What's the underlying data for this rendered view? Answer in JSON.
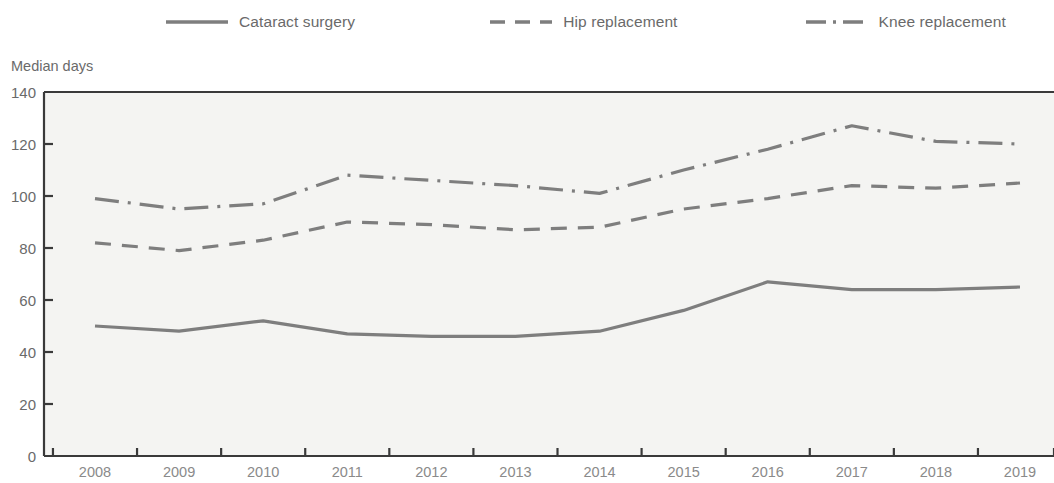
{
  "legend": {
    "items": [
      {
        "label": "Cataract surgery",
        "style": "solid",
        "icon": "solid-line-icon"
      },
      {
        "label": "Hip replacement",
        "style": "dashed",
        "icon": "dashed-line-icon"
      },
      {
        "label": "Knee replacement",
        "style": "dash-dot",
        "icon": "dash-dot-line-icon"
      }
    ]
  },
  "axis": {
    "y_title": "Median days",
    "y_ticks": [
      "0",
      "20",
      "40",
      "60",
      "80",
      "100",
      "120",
      "140"
    ],
    "x_ticks": [
      "2008",
      "2009",
      "2010",
      "2011",
      "2012",
      "2013",
      "2014",
      "2015",
      "2016",
      "2017",
      "2018",
      "2019"
    ]
  },
  "colors": {
    "line": "#7e7e7e",
    "axis": "#3a3a3a",
    "plot_background": "#f4f4f2",
    "tick_text": "#6a6a6a"
  },
  "chart_data": {
    "type": "line",
    "title": "",
    "subtitle": "",
    "xlabel": "",
    "ylabel": "Median days",
    "ylim": [
      0,
      140
    ],
    "ytick_step": 20,
    "grid": false,
    "legend_position": "top",
    "x": [
      2008,
      2009,
      2010,
      2011,
      2012,
      2013,
      2014,
      2015,
      2016,
      2017,
      2018,
      2019
    ],
    "categories": [
      "2008",
      "2009",
      "2010",
      "2011",
      "2012",
      "2013",
      "2014",
      "2015",
      "2016",
      "2017",
      "2018",
      "2019"
    ],
    "series": [
      {
        "name": "Cataract surgery",
        "style": "solid",
        "values": [
          50,
          48,
          52,
          47,
          46,
          46,
          48,
          56,
          67,
          64,
          64,
          65
        ]
      },
      {
        "name": "Hip replacement",
        "style": "dashed",
        "values": [
          82,
          79,
          83,
          90,
          89,
          87,
          88,
          95,
          99,
          104,
          103,
          105
        ]
      },
      {
        "name": "Knee replacement",
        "style": "dash-dot",
        "values": [
          99,
          95,
          97,
          108,
          106,
          104,
          101,
          110,
          118,
          127,
          121,
          120
        ]
      }
    ]
  }
}
